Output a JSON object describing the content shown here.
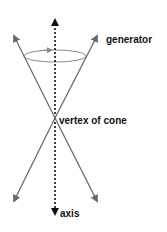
{
  "diagram": {
    "labels": {
      "generator": "generator",
      "vertex": "vertex of cone",
      "axis": "axis"
    },
    "colors": {
      "generator_line": "#6b6b6b",
      "axis_line": "#111111",
      "ellipse": "#8a8a8a",
      "text": "#111111",
      "background": "#ffffff"
    }
  }
}
